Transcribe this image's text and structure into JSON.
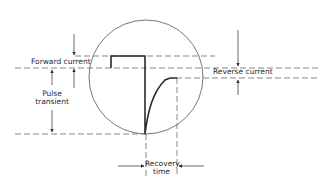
{
  "diagram": {
    "type": "pulse-transient-waveform",
    "labels": {
      "forward_current": "Forward current",
      "reverse_current": "Reverse current",
      "pulse_transient_line1": "Pulse",
      "pulse_transient_line2": "transient",
      "recovery_time_line1": "Recovery",
      "recovery_time_line2": "time"
    },
    "colors": {
      "line": "#2a2a2a",
      "dashed": "#555555",
      "circle": "#555555",
      "background": "#ffffff"
    }
  }
}
